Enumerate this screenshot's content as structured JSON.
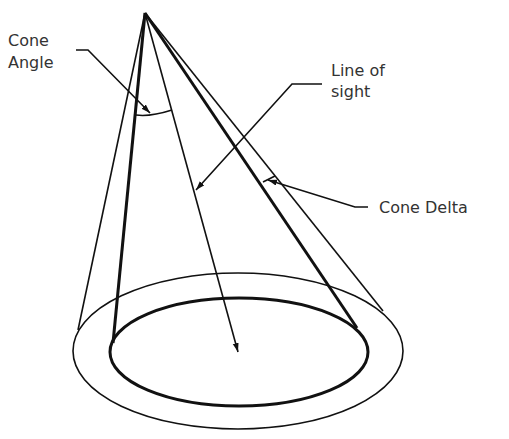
{
  "diagram": {
    "type": "cone-of-vision schematic",
    "labels": {
      "cone_angle_line1": "Cone",
      "cone_angle_line2": "Angle",
      "line_of_sight_line1": "Line of",
      "line_of_sight_line2": "sight",
      "cone_delta": "Cone Delta"
    },
    "colors": {
      "stroke": "#111111",
      "text": "#333333",
      "background": "#ffffff"
    }
  }
}
